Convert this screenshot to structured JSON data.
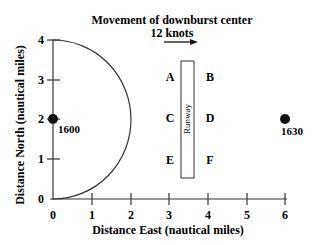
{
  "figure": {
    "title_line1": "Movement of downburst center",
    "title_line2": "12 knots",
    "arrow": "arrow-right-icon",
    "xlabel": "Distance East (nautical miles)",
    "ylabel": "Distance North (nautical miles)",
    "x_ticks": [
      "0",
      "1",
      "2",
      "3",
      "4",
      "5",
      "6"
    ],
    "y_ticks": [
      "0",
      "1",
      "2",
      "3",
      "4"
    ],
    "runway_label": "Runway",
    "points": [
      {
        "label": "1600",
        "x": 0,
        "y": 2
      },
      {
        "label": "1630",
        "x": 6,
        "y": 2
      }
    ],
    "position_labels": {
      "A": "A",
      "B": "B",
      "C": "C",
      "D": "D",
      "E": "E",
      "F": "F"
    },
    "semicircle": {
      "center_x": 0,
      "center_y": 2,
      "radius": 2
    },
    "runway": {
      "x_from": 3.3,
      "x_to": 3.65,
      "y_from": 0.55,
      "y_to": 3.5
    }
  },
  "colors": {
    "ink": "#111111",
    "background": "#ffffff"
  }
}
